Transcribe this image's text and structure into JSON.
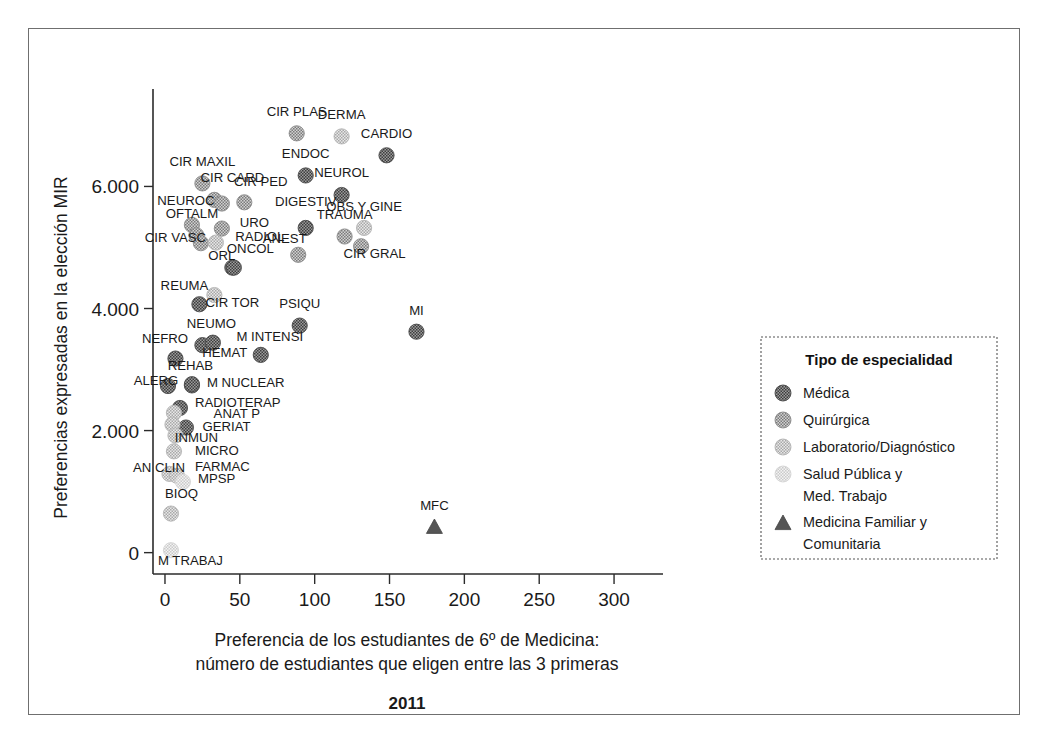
{
  "chart_data": {
    "type": "scatter",
    "title": "2011",
    "xlabel": "Preferencia de los estudiantes de 6º de Medicina:\nnúmero de estudiantes que eligen entre las 3 primeras",
    "xlabel_line1": "Preferencia de los estudiantes de 6º de Medicina:",
    "xlabel_line2": "número de estudiantes que eligen entre las 3 primeras",
    "ylabel": "Preferencias expresadas en la elección MIR",
    "xlim": [
      -8,
      318
    ],
    "ylim": [
      -350,
      7400
    ],
    "grid": false,
    "xticks": [
      0,
      50,
      100,
      150,
      200,
      250,
      300
    ],
    "xtick_labels": [
      "0",
      "50",
      "100",
      "150",
      "200",
      "250",
      "300"
    ],
    "yticks": [
      0,
      2000,
      4000,
      6000
    ],
    "ytick_labels": [
      "0",
      "2.000",
      "4.000",
      "6.000"
    ],
    "legend": {
      "title": "Tipo de especialidad",
      "position": "right",
      "entries": [
        {
          "label": "Médica",
          "marker": "circle",
          "color": "#6d6d6d"
        },
        {
          "label": "Quirúrgica",
          "marker": "circle",
          "color": "#9a9a9a"
        },
        {
          "label": "Laboratorio/Diagnóstico",
          "marker": "circle",
          "color": "#bdbdbd"
        },
        {
          "label": "Salud Pública y\nMed. Trabajo",
          "label_line1": "Salud Pública y",
          "label_line2": "Med. Trabajo",
          "marker": "circle",
          "color": "#dcdcdc"
        },
        {
          "label": "Medicina Familiar y\nComunitaria",
          "label_line1": "Medicina Familiar y",
          "label_line2": "Comunitaria",
          "marker": "triangle",
          "color": "#555555"
        }
      ]
    },
    "points": [
      {
        "label": "CIR PLAS",
        "x": 88,
        "y": 6870,
        "group": "Quirúrgica",
        "lx": 88,
        "ly": 7160,
        "anchor": "middle"
      },
      {
        "label": "DERMA",
        "x": 118,
        "y": 6820,
        "group": "Laboratorio/Diagnóstico",
        "lx": 118,
        "ly": 7110,
        "anchor": "middle"
      },
      {
        "label": "CARDIO",
        "x": 148,
        "y": 6510,
        "group": "Médica",
        "lx": 148,
        "ly": 6800,
        "anchor": "middle"
      },
      {
        "label": "ENDOC",
        "x": 94,
        "y": 6180,
        "group": "Médica",
        "lx": 94,
        "ly": 6470,
        "anchor": "middle"
      },
      {
        "label": "NEUROL",
        "x": 118,
        "y": 5860,
        "group": "Médica",
        "lx": 118,
        "ly": 6150,
        "anchor": "middle"
      },
      {
        "label": "CIR MAXIL",
        "x": 25,
        "y": 6050,
        "group": "Quirúrgica",
        "lx": 25,
        "ly": 6340,
        "anchor": "middle"
      },
      {
        "label": "CIR CARD",
        "x": 33,
        "y": 5780,
        "group": "Quirúrgica",
        "lx": 45,
        "ly": 6070,
        "anchor": "middle"
      },
      {
        "label": "CIR CARD2",
        "x": 38,
        "y": 5720,
        "group": "Quirúrgica",
        "lx": null,
        "ly": null,
        "anchor": "middle"
      },
      {
        "label": "CIR PED",
        "x": 53,
        "y": 5740,
        "group": "Quirúrgica",
        "lx": 64,
        "ly": 6000,
        "anchor": "middle"
      },
      {
        "label": "DIGESTIV",
        "x": 94,
        "y": 5320,
        "group": "Médica",
        "lx": 94,
        "ly": 5680,
        "anchor": "middle"
      },
      {
        "label": "NEUROC",
        "x": 18,
        "y": 5370,
        "group": "Quirúrgica",
        "lx": 14,
        "ly": 5700,
        "anchor": "middle"
      },
      {
        "label": "OFTALM",
        "x": 21,
        "y": 5200,
        "group": "Quirúrgica",
        "lx": 18,
        "ly": 5480,
        "anchor": "middle"
      },
      {
        "label": "URO",
        "x": 38,
        "y": 5310,
        "group": "Quirúrgica",
        "lx": 50,
        "ly": 5330,
        "anchor": "start"
      },
      {
        "label": "TRAUMA",
        "x": 120,
        "y": 5180,
        "group": "Quirúrgica",
        "lx": 120,
        "ly": 5470,
        "anchor": "middle"
      },
      {
        "label": "OBS Y GINE",
        "x": 133,
        "y": 5320,
        "group": "Laboratorio/Diagnóstico",
        "lx": 133,
        "ly": 5600,
        "anchor": "middle"
      },
      {
        "label": "CIR VASC",
        "x": 24,
        "y": 5070,
        "group": "Quirúrgica",
        "lx": 7,
        "ly": 5090,
        "anchor": "middle"
      },
      {
        "label": "RADIOL",
        "x": 34,
        "y": 5080,
        "group": "Laboratorio/Diagnóstico",
        "lx": 47,
        "ly": 5110,
        "anchor": "start"
      },
      {
        "label": "ANEST",
        "x": 89,
        "y": 4880,
        "group": "Quirúrgica",
        "lx": 80,
        "ly": 5070,
        "anchor": "middle"
      },
      {
        "label": "CIR GRAL",
        "x": 131,
        "y": 5020,
        "group": "Quirúrgica",
        "lx": 140,
        "ly": 4830,
        "anchor": "middle"
      },
      {
        "label": "ORL",
        "x": 45,
        "y": 4670,
        "group": "Médica",
        "lx": 38,
        "ly": 4790,
        "anchor": "middle"
      },
      {
        "label": "ONCOL",
        "x": 46,
        "y": 4670,
        "group": "Médica",
        "lx": 57,
        "ly": 4910,
        "anchor": "middle"
      },
      {
        "label": "CIR TOR",
        "x": 33,
        "y": 4220,
        "group": "Laboratorio/Diagnóstico",
        "lx": 45,
        "ly": 4020,
        "anchor": "middle"
      },
      {
        "label": "REUMA",
        "x": 23,
        "y": 4070,
        "group": "Médica",
        "lx": 13,
        "ly": 4300,
        "anchor": "middle"
      },
      {
        "label": "PSIQU",
        "x": 90,
        "y": 3720,
        "group": "Médica",
        "lx": 90,
        "ly": 4010,
        "anchor": "middle"
      },
      {
        "label": "MI",
        "x": 168,
        "y": 3620,
        "group": "Médica",
        "lx": 168,
        "ly": 3900,
        "anchor": "middle"
      },
      {
        "label": "NEUMO",
        "x": 25,
        "y": 3400,
        "group": "Médica",
        "lx": 31,
        "ly": 3680,
        "anchor": "middle"
      },
      {
        "label": "HEMAT",
        "x": 32,
        "y": 3440,
        "group": "Médica",
        "lx": 40,
        "ly": 3200,
        "anchor": "middle"
      },
      {
        "label": "M INTENSI",
        "x": 64,
        "y": 3240,
        "group": "Médica",
        "lx": 70,
        "ly": 3470,
        "anchor": "middle"
      },
      {
        "label": "NEFRO",
        "x": 7,
        "y": 3180,
        "group": "Médica",
        "lx": 0,
        "ly": 3440,
        "anchor": "middle"
      },
      {
        "label": "M NUCLEAR",
        "x": 18,
        "y": 2740,
        "group": "Médica",
        "lx": 28,
        "ly": 2710,
        "anchor": "start"
      },
      {
        "label": "REHAB",
        "x": 18,
        "y": 2760,
        "group": "Médica",
        "lx": 17,
        "ly": 2990,
        "anchor": "middle"
      },
      {
        "label": "ALERG",
        "x": 2,
        "y": 2730,
        "group": "Médica",
        "lx": -6,
        "ly": 2750,
        "anchor": "middle"
      },
      {
        "label": "RADIOTERAP",
        "x": 10,
        "y": 2370,
        "group": "Médica",
        "lx": 20,
        "ly": 2390,
        "anchor": "start"
      },
      {
        "label": "ANAT P",
        "x": 6,
        "y": 2290,
        "group": "Laboratorio/Diagnóstico",
        "lx": 48,
        "ly": 2210,
        "anchor": "middle"
      },
      {
        "label": "GERIAT",
        "x": 14,
        "y": 2050,
        "group": "Médica",
        "lx": 25,
        "ly": 1990,
        "anchor": "start"
      },
      {
        "label": "INMUN",
        "x": 5,
        "y": 2100,
        "group": "Laboratorio/Diagnóstico",
        "lx": 21,
        "ly": 1820,
        "anchor": "middle"
      },
      {
        "label": "NEUROFIS",
        "x": 7,
        "y": 1920,
        "group": "Laboratorio/Diagnóstico",
        "lx": null,
        "ly": null,
        "anchor": "middle"
      },
      {
        "label": "MICRO",
        "x": 6,
        "y": 1660,
        "group": "Laboratorio/Diagnóstico",
        "lx": 20,
        "ly": 1600,
        "anchor": "start"
      },
      {
        "label": "AN CLIN",
        "x": 3,
        "y": 1290,
        "group": "Laboratorio/Diagnóstico",
        "lx": -4,
        "ly": 1320,
        "anchor": "middle"
      },
      {
        "label": "FARMAC",
        "x": 8,
        "y": 1260,
        "group": "Laboratorio/Diagnóstico",
        "lx": 20,
        "ly": 1330,
        "anchor": "start"
      },
      {
        "label": "MPSP",
        "x": 12,
        "y": 1160,
        "group": "Salud Pública y Med. Trabajo",
        "lx": 22,
        "ly": 1140,
        "anchor": "start"
      },
      {
        "label": "BIOQ",
        "x": 4,
        "y": 640,
        "group": "Laboratorio/Diagnóstico",
        "lx": 11,
        "ly": 900,
        "anchor": "middle"
      },
      {
        "label": "M TRABAJ",
        "x": 4,
        "y": 40,
        "group": "Salud Pública y Med. Trabajo",
        "lx": 17,
        "ly": -210,
        "anchor": "middle"
      },
      {
        "label": "MFC",
        "x": 180,
        "y": 420,
        "group": "Medicina Familiar y Comunitaria",
        "lx": 180,
        "ly": 700,
        "anchor": "middle"
      }
    ]
  }
}
